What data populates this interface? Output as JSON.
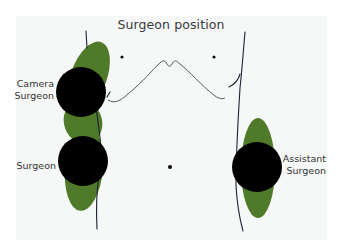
{
  "title": "Surgeon position",
  "labels": {
    "camera_surgeon": [
      "Camera",
      "Surgeon"
    ],
    "surgeon": "Surgeon",
    "assistant_surgeon": [
      "Assistant",
      "Surgeon"
    ]
  },
  "colors": {
    "background": "#f6f7f7",
    "green": "#4e7a2a",
    "black": "#000000",
    "outline": "#1c2333"
  }
}
